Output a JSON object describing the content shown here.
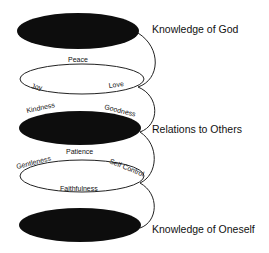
{
  "diagram": {
    "levels": [
      {
        "label": "Knowledge of God"
      },
      {
        "label": "Relations to Others"
      },
      {
        "label": "Knowledge of Oneself"
      }
    ],
    "ring1": {
      "top": "Peace",
      "left": "Joy",
      "right": "Love",
      "below_left": "Kindness",
      "below_right": "Goodness"
    },
    "ring2": {
      "top": "Patience",
      "left": "Gentleness",
      "right": "Self Control",
      "bottom": "Faithfulness"
    },
    "colors": {
      "fill": "#0d0d0d",
      "stroke": "#222222",
      "background": "#ffffff"
    }
  }
}
